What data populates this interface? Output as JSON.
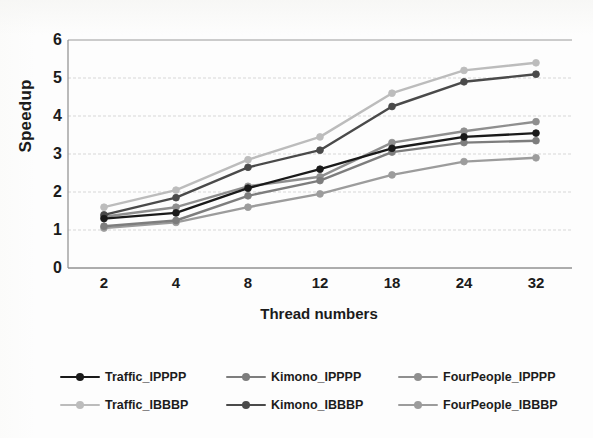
{
  "chart_data": {
    "type": "line",
    "title": "",
    "xlabel": "Thread numbers",
    "ylabel": "Speedup",
    "categories": [
      "2",
      "4",
      "8",
      "12",
      "18",
      "24",
      "32"
    ],
    "x": [
      2,
      4,
      8,
      12,
      18,
      24,
      32
    ],
    "ylim": [
      0,
      6
    ],
    "yticks": [
      "0",
      "1",
      "2",
      "3",
      "4",
      "5",
      "6"
    ],
    "grid": true,
    "legend_position": "bottom",
    "legend_columns": 3,
    "legend_rows": 2,
    "series": [
      {
        "name": "Traffic_IPPPP",
        "color": "#1a1a1a",
        "values": [
          1.3,
          1.45,
          2.1,
          2.6,
          3.15,
          3.45,
          3.55
        ]
      },
      {
        "name": "Kimono_IPPPP",
        "color": "#7d7d7d",
        "values": [
          1.1,
          1.25,
          1.9,
          2.3,
          3.05,
          3.3,
          3.35
        ]
      },
      {
        "name": "FourPeople_IPPPP",
        "color": "#8f8f8f",
        "values": [
          1.35,
          1.6,
          2.15,
          2.4,
          3.3,
          3.6,
          3.85
        ]
      },
      {
        "name": "Traffic_IBBBP",
        "color": "#bcbcbc",
        "values": [
          1.6,
          2.05,
          2.85,
          3.45,
          4.6,
          5.2,
          5.4
        ]
      },
      {
        "name": "Kimono_IBBBP",
        "color": "#4a4a4a",
        "values": [
          1.4,
          1.85,
          2.65,
          3.1,
          4.25,
          4.9,
          5.1
        ]
      },
      {
        "name": "FourPeople_IBBBP",
        "color": "#9c9c9c",
        "values": [
          1.05,
          1.2,
          1.6,
          1.95,
          2.45,
          2.8,
          2.9
        ]
      }
    ]
  },
  "axes": {
    "y_title": "Speedup",
    "x_title": "Thread numbers"
  }
}
